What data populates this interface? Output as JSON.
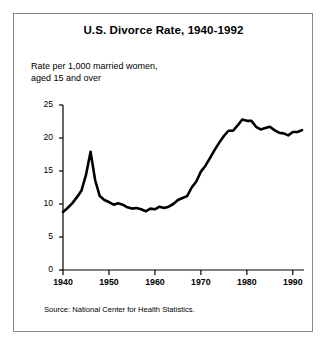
{
  "figure": {
    "title": "U.S. Divorce Rate, 1940-1992",
    "subtitle_line1": "Rate per 1,000 married women,",
    "subtitle_line2": "aged 15 and over",
    "source": "Source: National Center for Health Statistics.",
    "background_color": "#ffffff",
    "frame_color": "#8a8a8a",
    "line_color": "#000000",
    "axis_color": "#000000"
  },
  "chart_data": {
    "type": "line",
    "title": "U.S. Divorce Rate, 1940-1992",
    "subtitle": "Rate per 1,000 married women, aged 15 and over",
    "xlabel": "",
    "ylabel": "",
    "xlim": [
      1940,
      1992
    ],
    "ylim": [
      0,
      25
    ],
    "grid": false,
    "legend": "none",
    "source": "Source: National Center for Health Statistics.",
    "xticks": [
      1940,
      1950,
      1960,
      1970,
      1980,
      1990
    ],
    "xtick_labels": [
      "1940",
      "1950",
      "1960",
      "1970",
      "1980",
      "1990"
    ],
    "yticks": [
      0,
      5,
      10,
      15,
      20,
      25
    ],
    "ytick_labels": [
      "0",
      "5",
      "10",
      "15",
      "20",
      "25"
    ],
    "series": [
      {
        "name": "Divorce rate per 1,000 married women aged 15+",
        "x": [
          1940,
          1941,
          1942,
          1943,
          1944,
          1945,
          1946,
          1947,
          1948,
          1949,
          1950,
          1951,
          1952,
          1953,
          1954,
          1955,
          1956,
          1957,
          1958,
          1959,
          1960,
          1961,
          1962,
          1963,
          1964,
          1965,
          1966,
          1967,
          1968,
          1969,
          1970,
          1971,
          1972,
          1973,
          1974,
          1975,
          1976,
          1977,
          1978,
          1979,
          1980,
          1981,
          1982,
          1983,
          1984,
          1985,
          1986,
          1987,
          1988,
          1989,
          1990,
          1991,
          1992
        ],
        "values": [
          8.8,
          9.4,
          10.1,
          11.0,
          12.0,
          14.4,
          17.9,
          13.6,
          11.2,
          10.6,
          10.3,
          9.9,
          10.1,
          9.9,
          9.5,
          9.3,
          9.4,
          9.2,
          8.9,
          9.3,
          9.2,
          9.6,
          9.4,
          9.6,
          10.0,
          10.6,
          10.9,
          11.2,
          12.5,
          13.4,
          14.9,
          15.8,
          17.0,
          18.2,
          19.3,
          20.3,
          21.1,
          21.1,
          21.9,
          22.8,
          22.6,
          22.6,
          21.7,
          21.3,
          21.5,
          21.7,
          21.2,
          20.8,
          20.7,
          20.4,
          20.9,
          20.9,
          21.2
        ]
      }
    ]
  },
  "axes": {
    "y_ticks": [
      {
        "value": 25,
        "label": "25"
      },
      {
        "value": 20,
        "label": "20"
      },
      {
        "value": 15,
        "label": "15"
      },
      {
        "value": 10,
        "label": "10"
      },
      {
        "value": 5,
        "label": "5"
      },
      {
        "value": 0,
        "label": "0"
      }
    ],
    "x_ticks": [
      {
        "value": 1940,
        "label": "1940"
      },
      {
        "value": 1950,
        "label": "1950"
      },
      {
        "value": 1960,
        "label": "1960"
      },
      {
        "value": 1970,
        "label": "1970"
      },
      {
        "value": 1980,
        "label": "1980"
      },
      {
        "value": 1990,
        "label": "1990"
      }
    ]
  }
}
